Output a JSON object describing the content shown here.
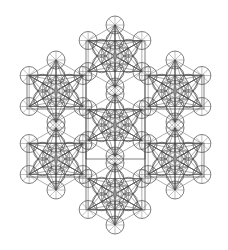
{
  "figure": {
    "width": 228,
    "height": 250,
    "background": "#ffffff",
    "line_color": "#4a4a4a",
    "rosette_color": "#9a9a9a",
    "line_width": 0.7,
    "cluster_radius": 31,
    "node_circle_radius": 9,
    "inner_circle_radius": 9,
    "clusters": [
      {
        "name": "top",
        "cx": 115,
        "cy": 56
      },
      {
        "name": "upper-left",
        "cx": 56,
        "cy": 91
      },
      {
        "name": "upper-right",
        "cx": 175,
        "cy": 91
      },
      {
        "name": "center",
        "cx": 115,
        "cy": 125
      },
      {
        "name": "lower-left",
        "cx": 56,
        "cy": 159
      },
      {
        "name": "lower-right",
        "cx": 175,
        "cy": 159
      },
      {
        "name": "bottom",
        "cx": 115,
        "cy": 194
      }
    ],
    "frames": [
      {
        "name": "top-frame",
        "x": 86,
        "y": 41,
        "w": 59,
        "h": 118
      },
      {
        "name": "left-frame",
        "x": 27,
        "y": 75,
        "w": 59,
        "h": 34
      },
      {
        "name": "right-frame",
        "x": 145,
        "y": 75,
        "w": 59,
        "h": 34
      },
      {
        "name": "lower-left-frame",
        "x": 27,
        "y": 143,
        "w": 59,
        "h": 34
      },
      {
        "name": "lower-right-frame",
        "x": 145,
        "y": 143,
        "w": 59,
        "h": 34
      },
      {
        "name": "bottom-frame",
        "x": 86,
        "y": 110,
        "w": 59,
        "h": 100
      }
    ]
  }
}
